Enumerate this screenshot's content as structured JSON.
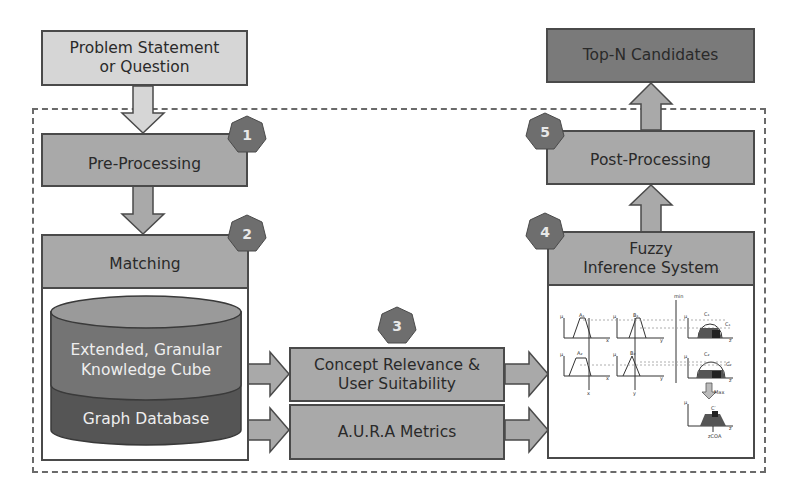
{
  "nodes": {
    "problem": {
      "label": "Problem Statement\nor Question",
      "line1": "Problem Statement",
      "line2": "or Question"
    },
    "preprocessing": {
      "label": "Pre-Processing",
      "step": "1"
    },
    "matching": {
      "label": "Matching",
      "step": "2"
    },
    "knowledge_cube": {
      "line1": "Extended, Granular",
      "line2": "Knowledge Cube"
    },
    "graph_db": {
      "label": "Graph Database"
    },
    "concept_relevance": {
      "line1": "Concept Relevance &",
      "line2": "User Suitability",
      "step": "3"
    },
    "aura": {
      "label": "A.U.R.A Metrics"
    },
    "fuzzy": {
      "line1": "Fuzzy",
      "line2": "Inference System",
      "step": "4"
    },
    "postprocessing": {
      "label": "Post-Processing",
      "step": "5"
    },
    "topn": {
      "label": "Top-N Candidates"
    }
  },
  "fuzzy_plot": {
    "labels": [
      "A1",
      "B1",
      "C1",
      "A2",
      "B2",
      "C2",
      "C'",
      "Max",
      "min",
      "x",
      "y",
      "z",
      "zCOA"
    ]
  },
  "colors": {
    "light": "#d6d6d6",
    "mid": "#a9a9a9",
    "dark": "#7a7a7a",
    "badge": "#6e6e6e",
    "cyl_top": "#9a9a9a",
    "cyl_mid": "#747474",
    "cyl_bottom": "#555555"
  }
}
